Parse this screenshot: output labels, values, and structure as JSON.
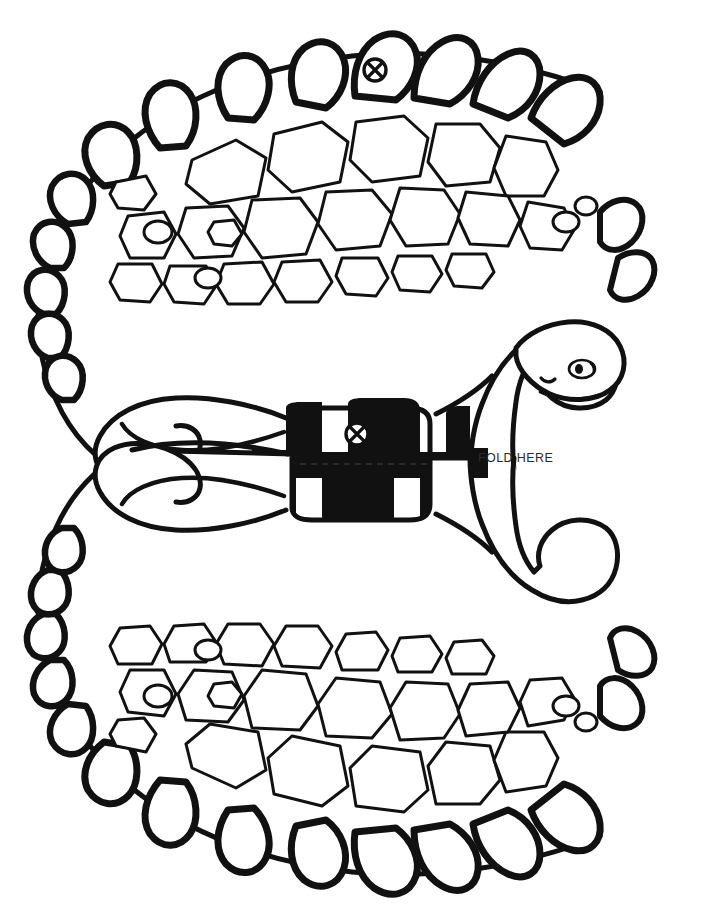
{
  "page": {
    "width": 701,
    "height": 918,
    "background_color": "#ffffff",
    "ink_color": "#111111"
  },
  "artwork": {
    "subject": "dinosaur-fold-template",
    "description": "Black ink line drawing of a stegosaurus-like dinosaur duplicated and mirrored about a horizontal fold line, forming an S / C shaped silhouette. Back and tail are lined with triangular plates and spikes; body interior is filled with an irregular polygonal scale pattern.",
    "style": "line-art",
    "colors": {
      "outline": "#111111",
      "fill": "#ffffff",
      "label_text": "#2b2b2b",
      "fold_line": "#333333"
    }
  },
  "annotations": {
    "fold_label": "FOLD HERE",
    "fold_line": {
      "style": "dashed",
      "y": 464,
      "x_start": 190,
      "x_end": 474
    },
    "registration_marks": [
      {
        "name": "circle-x-mark-top",
        "cx": 375,
        "cy": 70,
        "r": 11
      },
      {
        "name": "circle-x-mark-middle",
        "cx": 357,
        "cy": 434,
        "r": 11
      }
    ]
  }
}
